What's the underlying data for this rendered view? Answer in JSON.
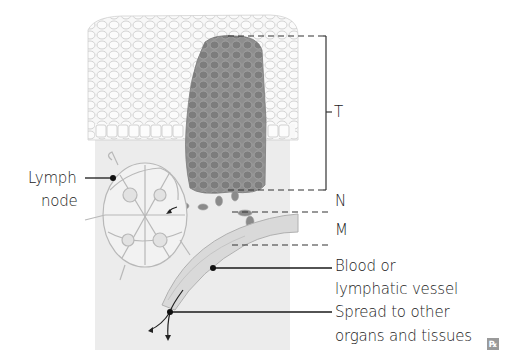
{
  "diagram": {
    "stages": {
      "t": "T",
      "n": "N",
      "m": "M"
    },
    "labels": {
      "lymph_node_line1": "Lymph",
      "lymph_node_line2": "node",
      "vessel_line1": "Blood or",
      "vessel_line2": "lymphatic vessel",
      "spread_line1": "Spread to other",
      "spread_line2": "organs and tissues"
    },
    "watermark": "℞",
    "colors": {
      "epithelium": "#f4f4f4",
      "cell_outline": "#c8c8c8",
      "stroma": "#ebebeb",
      "tumor": "#8c8c8c",
      "tumor_cell": "#7a7a7a",
      "vessel": "#d6d6d6",
      "line": "#222222"
    }
  }
}
